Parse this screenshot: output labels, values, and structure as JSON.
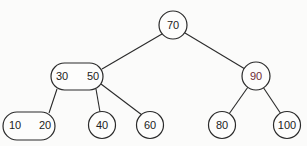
{
  "diagram": {
    "type": "2-3 tree",
    "nodes": [
      {
        "id": "root",
        "keys": [
          "70"
        ]
      },
      {
        "id": "left",
        "keys": [
          "30",
          "50"
        ]
      },
      {
        "id": "right",
        "keys": [
          "90"
        ]
      },
      {
        "id": "ll",
        "keys": [
          "10",
          "20"
        ]
      },
      {
        "id": "lm",
        "keys": [
          "40"
        ]
      },
      {
        "id": "lr",
        "keys": [
          "60"
        ]
      },
      {
        "id": "rl",
        "keys": [
          "80"
        ]
      },
      {
        "id": "rr",
        "keys": [
          "100"
        ]
      }
    ],
    "edges": [
      [
        "root",
        "left"
      ],
      [
        "root",
        "right"
      ],
      [
        "left",
        "ll"
      ],
      [
        "left",
        "lm"
      ],
      [
        "left",
        "lr"
      ],
      [
        "right",
        "rl"
      ],
      [
        "right",
        "rr"
      ]
    ],
    "labels": {
      "n70": "70",
      "n30": "30",
      "n50": "50",
      "n90": "90",
      "n10": "10",
      "n20": "20",
      "n40": "40",
      "n60": "60",
      "n80": "80",
      "n100": "100"
    },
    "colors": {
      "stroke": "#2a2a2a",
      "text": "#222222",
      "highlight_text": "#7a2a3a",
      "background": "#fbfbfa"
    }
  }
}
